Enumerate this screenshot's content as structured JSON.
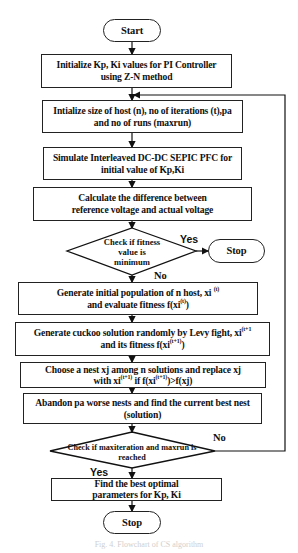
{
  "flowchart": {
    "start": "Start",
    "steps": {
      "init_kp_ki": "Initialize Kp, Ki values for PI Controller using Z-N method",
      "init_size": "Intialize size of host (n), no of iterations (t),pa and no of runs (maxrun)",
      "simulate": "Simulate Interleaved DC-DC SEPIC PFC for initial value of Kp,Ki",
      "calculate": "Calculate the difference between reference voltage and actual voltage",
      "generate_population_pre": "Generate initial population of n host, xi",
      "generate_population_sup1": "(t)",
      "generate_population_mid": "and evaluate fitness f(xi",
      "generate_population_sup2": "(t)",
      "generate_population_post": ")",
      "generate_cuckoo_pre": "Generate cuckoo solution randomly by Levy fight, xi",
      "generate_cuckoo_sup1": "(t+1",
      "generate_cuckoo_mid": "and its fitness f(xi",
      "generate_cuckoo_sup2": "(t+1)",
      "generate_cuckoo_post": ")",
      "choose_nest_line1": "Choose a nest xj among n solutions and replace xj",
      "choose_nest_pre": "with  xi",
      "choose_nest_sup1": "(t+1)",
      "choose_nest_mid": " if f(xi",
      "choose_nest_sup2": "(t+1)",
      "choose_nest_post": ")>f(xj)",
      "abandon": "Abandon pa worse nests and find the current best nest (solution)",
      "find_best": "Find the best optimal parameters for Kp, Ki"
    },
    "decisions": {
      "fitness_check": "Check if fitness value is minimum",
      "max_check": "Check if maxiteration and maxrun is reached"
    },
    "branch_labels": {
      "fitness_yes": "Yes",
      "fitness_no": "No",
      "max_no": "No",
      "max_yes": "Yes"
    },
    "stop_1": "Stop",
    "stop_2": "Stop"
  },
  "caption": "Fig. 4. Flowchart of CS algorithm"
}
